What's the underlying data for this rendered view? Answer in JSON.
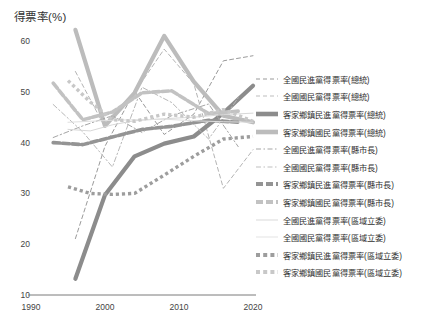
{
  "chart_data": {
    "type": "line",
    "title": "",
    "ylabel": "得票率(%)",
    "xlabel": "",
    "ylim": [
      10,
      60
    ],
    "xlim": [
      1990,
      2020
    ],
    "yticks": [
      60,
      50,
      40,
      30,
      20,
      10
    ],
    "xticks": [
      1990,
      2000,
      2010,
      2020
    ],
    "grid": false,
    "legend_position": "right",
    "series": [
      {
        "name": "全國民進黨得票率(總統)",
        "style": "dashed-thin",
        "color": "#9a9a9a",
        "width": 1,
        "x": [
          1996,
          2000,
          2004,
          2008,
          2012,
          2016,
          2020
        ],
        "y": [
          21.1,
          39.3,
          50.1,
          41.6,
          45.6,
          56.1,
          57.1
        ]
      },
      {
        "name": "全國國民黨得票率(總統)",
        "style": "dashed-thin",
        "color": "#b4b4b4",
        "width": 1,
        "x": [
          1996,
          2000,
          2004,
          2008,
          2012,
          2016,
          2020
        ],
        "y": [
          54.0,
          43.0,
          49.9,
          58.4,
          51.6,
          31.0,
          38.6
        ]
      },
      {
        "name": "客家鄉鎮民進黨得票率(總統)",
        "style": "solid-thick",
        "color": "#8c8c8c",
        "width": 4.2,
        "x": [
          1996,
          2000,
          2004,
          2008,
          2012,
          2016,
          2020
        ],
        "y": [
          13.2,
          29.7,
          37.3,
          39.8,
          41.2,
          45.8,
          51.2
        ]
      },
      {
        "name": "客家鄉鎮國民黨得票率(總統)",
        "style": "solid-thick",
        "color": "#bcbcbc",
        "width": 4.2,
        "x": [
          1996,
          2000,
          2004,
          2008,
          2012,
          2016,
          2020
        ],
        "y": [
          62.2,
          43.3,
          49.8,
          61.0,
          52.0,
          45.3,
          44.0
        ]
      },
      {
        "name": "全國民進黨得票率(縣市長)",
        "style": "dashdot-thin",
        "color": "#a5a5a5",
        "width": 1,
        "x": [
          1993,
          1997,
          2001,
          2005,
          2009,
          2014,
          2018
        ],
        "y": [
          41.0,
          43.3,
          45.3,
          42.0,
          45.3,
          47.6,
          39.2
        ]
      },
      {
        "name": "全國國民黨得票率(縣市長)",
        "style": "dashdot-thin",
        "color": "#b8b8b8",
        "width": 1,
        "x": [
          1993,
          1997,
          2001,
          2005,
          2009,
          2014,
          2018
        ],
        "y": [
          47.5,
          42.1,
          35.2,
          50.9,
          47.9,
          40.7,
          48.8
        ]
      },
      {
        "name": "客家鄉鎮民進黨得票率(縣市長)",
        "style": "dashed-thick",
        "color": "#949494",
        "width": 3.6,
        "x": [
          1993,
          1997,
          2001,
          2005,
          2009,
          2014,
          2018
        ],
        "y": [
          40.0,
          39.6,
          41.1,
          42.6,
          43.2,
          44.4,
          44.0
        ]
      },
      {
        "name": "客家鄉鎮國民黨得票率(縣市長)",
        "style": "dashed-thick",
        "color": "#c2c2c2",
        "width": 3.6,
        "x": [
          1993,
          1997,
          2001,
          2005,
          2009,
          2014,
          2018
        ],
        "y": [
          51.7,
          44.5,
          46.0,
          49.8,
          50.2,
          45.7,
          46.2
        ]
      },
      {
        "name": "全國民進黨得票率(區域立委)",
        "style": "solid-thin",
        "color": "#d8d8d8",
        "width": 1,
        "x": [
          1995,
          1998,
          2001,
          2004,
          2008,
          2012,
          2016,
          2020
        ],
        "y": [
          42.6,
          42.3,
          43.5,
          44.3,
          44.7,
          45.0,
          45.5,
          45.8
        ]
      },
      {
        "name": "全國國民黨得票率(區域立委)",
        "style": "solid-thin",
        "color": "#e0e0e0",
        "width": 1,
        "x": [
          1995,
          1998,
          2001,
          2004,
          2008,
          2012,
          2016,
          2020
        ],
        "y": [
          44.0,
          44.2,
          44.4,
          44.5,
          44.6,
          44.3,
          44.1,
          44.0
        ]
      },
      {
        "name": "客家鄉鎮民進黨得票率(區域立委)",
        "style": "dotted-thick",
        "color": "#9d9d9d",
        "width": 3.4,
        "x": [
          1995,
          1998,
          2001,
          2004,
          2008,
          2012,
          2016,
          2020
        ],
        "y": [
          31.3,
          30.0,
          29.8,
          30.0,
          33.6,
          37.3,
          40.7,
          41.2
        ]
      },
      {
        "name": "客家鄉鎮國民黨得票率(區域立委)",
        "style": "dotted-thick",
        "color": "#c8c8c8",
        "width": 3.4,
        "x": [
          1995,
          1998,
          2001,
          2004,
          2008,
          2012,
          2016,
          2020
        ],
        "y": [
          52.2,
          48.0,
          44.5,
          44.2,
          45.6,
          45.0,
          46.5,
          44.2
        ]
      }
    ]
  },
  "axis": {
    "ylabel": "得票率(%)",
    "ytick_labels": [
      "60",
      "50",
      "40",
      "30",
      "20",
      "10"
    ],
    "xtick_labels": [
      "1990",
      "2000",
      "2010",
      "2020"
    ]
  },
  "legend": {
    "items": [
      {
        "label": "全國民進黨得票率(總統)",
        "key": "dashed-thin-dark"
      },
      {
        "label": "全國國民黨得票率(總統)",
        "key": "dashed-thin-light"
      },
      {
        "label": "客家鄉鎮民進黨得票率(總統)",
        "key": "solid-thick-dark"
      },
      {
        "label": "客家鄉鎮國民黨得票率(總統)",
        "key": "solid-thick-light"
      },
      {
        "label": "全國民進黨得票率(縣市長)",
        "key": "dashdot-thin-dark"
      },
      {
        "label": "全國國民黨得票率(縣市長)",
        "key": "dashdot-thin-light"
      },
      {
        "label": "客家鄉鎮民進黨得票率(縣市長)",
        "key": "dashed-thick-dark"
      },
      {
        "label": "客家鄉鎮國民黨得票率(縣市長)",
        "key": "dashed-thick-light"
      },
      {
        "label": "全國民進黨得票率(區域立委)",
        "key": "solid-thin-dark"
      },
      {
        "label": "全國國民黨得票率(區域立委)",
        "key": "solid-thin-light"
      },
      {
        "label": "客家鄉鎮民進黨得票率(區域立委)",
        "key": "dotted-thick-dark"
      },
      {
        "label": "客家鄉鎮國民黨得票率(區域立委)",
        "key": "dotted-thick-light"
      }
    ]
  },
  "colors": {
    "axis": "#7a7a7a",
    "text": "#333333",
    "dpp_dark": "#8c8c8c",
    "kmt_light": "#bcbcbc"
  }
}
